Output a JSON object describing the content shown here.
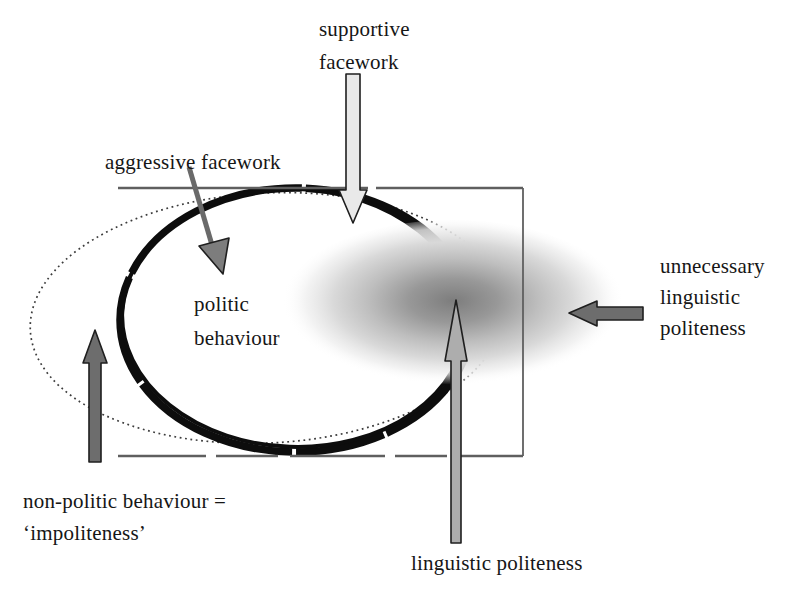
{
  "diagram": {
    "labels": {
      "supportive_facework": [
        "supportive",
        "facework"
      ],
      "aggressive_facework": "aggressive facework",
      "politic_behaviour": [
        "politic",
        "behaviour"
      ],
      "unnecessary_linguistic_politeness": [
        "unnecessary",
        "linguistic",
        "politeness"
      ],
      "non_politic_behaviour": [
        "non-politic behaviour =",
        "‘impoliteness’"
      ],
      "linguistic_politeness": "linguistic politeness"
    }
  },
  "colors": {
    "text": "#161616",
    "ellipse_stroke": "#0d0d0d",
    "dotted_stroke": "#3c3c3c",
    "rect_stroke": "#5f5f5f",
    "arrow_outline": "#1f1f1f",
    "light_arrow": "#e9e9e9",
    "medium_arrow": "#adadad",
    "dark_arrow": "#6d6d6d",
    "diagonal_arrow": "#7d7d7d",
    "blob_core": "#7d7d7d"
  }
}
